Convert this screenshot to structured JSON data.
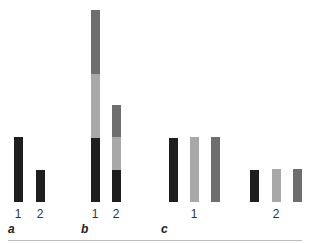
{
  "colors": {
    "dark": "#1e1e1e",
    "light": "#a8a8a8",
    "mid": "#6e6e6e",
    "rule": "#bdbdbd"
  },
  "chart_data": [
    {
      "panel": "a",
      "type": "bar",
      "categories": [
        "1",
        "2"
      ],
      "values": [
        65,
        32
      ],
      "title": "",
      "xlabel": "",
      "ylabel": "",
      "grid": false
    },
    {
      "panel": "b",
      "type": "bar",
      "stacked": true,
      "categories": [
        "1",
        "2"
      ],
      "series": [
        {
          "name": "dark",
          "values": [
            64,
            32
          ]
        },
        {
          "name": "light",
          "values": [
            64,
            33
          ]
        },
        {
          "name": "mid",
          "values": [
            64,
            32
          ]
        }
      ],
      "totals": [
        192,
        97
      ],
      "title": "",
      "xlabel": "",
      "ylabel": "",
      "grid": false
    },
    {
      "panel": "c",
      "type": "bar",
      "grouped": true,
      "categories": [
        "1",
        "2"
      ],
      "series": [
        {
          "name": "dark",
          "values": [
            64,
            32
          ]
        },
        {
          "name": "light",
          "values": [
            65,
            33
          ]
        },
        {
          "name": "mid",
          "values": [
            65,
            33
          ]
        }
      ],
      "title": "",
      "xlabel": "",
      "ylabel": "",
      "grid": false
    }
  ],
  "labels": {
    "a": {
      "panel": "a",
      "cat1": "1",
      "cat2": "2"
    },
    "b": {
      "panel": "b",
      "cat1": "1",
      "cat2": "2"
    },
    "c": {
      "panel": "c",
      "cat1": "1",
      "cat2": "2"
    }
  }
}
